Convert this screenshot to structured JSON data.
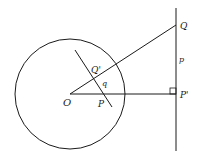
{
  "diagram": {
    "labels": {
      "O": "O",
      "P": "P",
      "Q_prime": "Q'",
      "q": "q",
      "Q": "Q",
      "p": "p",
      "P_prime": "P'"
    },
    "colors": {
      "stroke": "#1a1a1a",
      "background": "#ffffff"
    }
  }
}
